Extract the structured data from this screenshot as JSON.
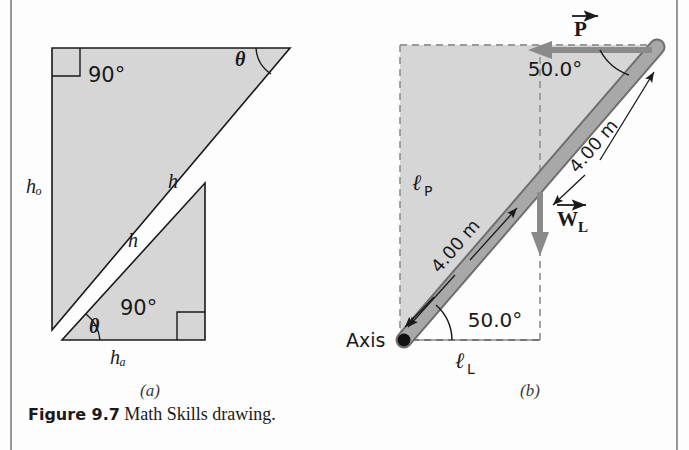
{
  "figure": {
    "caption_label": "Figure 9.7",
    "caption_text": "Math Skills drawing.",
    "panel_a_label": "(a)",
    "panel_b_label": "(b)"
  },
  "panel_a": {
    "name": "similar-right-triangles",
    "upper_triangle": {
      "right_angle_label": "90°",
      "angle_label": "θ",
      "opposite_side_label": "hₒ",
      "hypotenuse_label": "h"
    },
    "lower_triangle": {
      "right_angle_label": "90°",
      "angle_label": "θ",
      "adjacent_side_label": "hₐ",
      "hypotenuse_label": "h"
    }
  },
  "panel_b": {
    "name": "rod-on-axis-free-body",
    "force_p_label": "P",
    "weight_label": "W",
    "weight_subscript": "L",
    "angle_top_label": "50.0°",
    "angle_bottom_label": "50.0°",
    "length_label_upper": "4.00 m",
    "length_label_lower": "4.00 m",
    "lever_arm_p_label": "ℓ",
    "lever_arm_p_sub": "P",
    "lever_arm_l_label": "ℓ",
    "lever_arm_l_sub": "L",
    "axis_label": "Axis"
  },
  "colors": {
    "shape_fill": "#d6d6d6",
    "rod_fill": "#a8a8a8",
    "rod_edge": "#6e6e6e",
    "stroke": "#1a1a1a",
    "arrow_gray": "#888888",
    "rule": "#9a9a9a"
  }
}
